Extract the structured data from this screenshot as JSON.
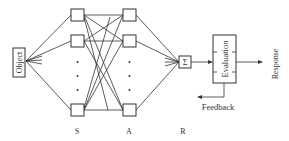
{
  "diagram": {
    "type": "perceptron-network",
    "colors": {
      "line": "#333333",
      "background": "#ffffff"
    },
    "input": {
      "label": "Object"
    },
    "layers": [
      {
        "id": "S",
        "label": "S",
        "visible_units": 3,
        "has_ellipsis": true
      },
      {
        "id": "A",
        "label": "A",
        "visible_units": 3,
        "has_ellipsis": true
      },
      {
        "id": "R",
        "label": "R"
      }
    ],
    "summation": {
      "symbol": "Σ"
    },
    "evaluation": {
      "label": "Evaluation"
    },
    "output": {
      "label": "Response"
    },
    "feedback": {
      "label": "Feedback"
    }
  }
}
